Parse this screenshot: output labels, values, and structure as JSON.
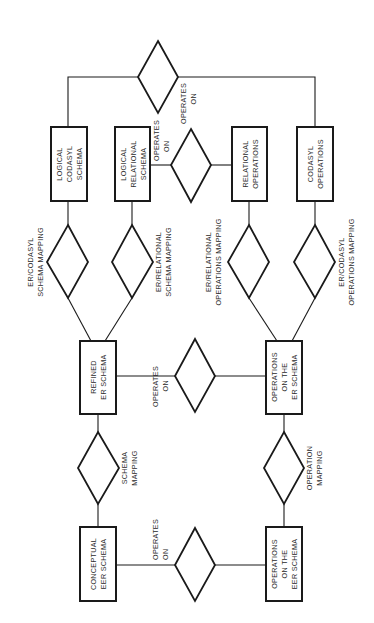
{
  "diagram": {
    "entities": {
      "logical_codasyl_schema": [
        "LOGICAL",
        "CODASYL",
        "SCHEMA"
      ],
      "logical_relational_schema": [
        "LOGICAL",
        "RELATIONAL",
        "SCHEMA"
      ],
      "relational_operations": [
        "RELATIONAL",
        "OPERATIONS"
      ],
      "codasyl_operations": [
        "CODASYL",
        "OPERATIONS"
      ],
      "refined_er_schema": [
        "REFINED",
        "ER SCHEMA"
      ],
      "operations_on_er_schema": [
        "OPERATIONS",
        "ON THE",
        "ER SCHEMA"
      ],
      "conceptual_eer_schema": [
        "CONCEPTUAL",
        "EER SCHEMA"
      ],
      "operations_on_eer_schema": [
        "OPERATIONS",
        "ON THE",
        "EER SCHEMA"
      ]
    },
    "relationships": {
      "top_operates_on": [
        "OPERATES",
        "ON"
      ],
      "relational_operates_on": [
        "OPERATES",
        "ON"
      ],
      "er_codasyl_schema_mapping": [
        "ER/CODASYL",
        "SCHEMA MAPPING"
      ],
      "er_relational_schema_mapping": [
        "ER/RELATIONAL",
        "SCHEMA MAPPING"
      ],
      "er_relational_operations_mapping": [
        "ER/RELATIONAL",
        "OPERATIONS MAPPING"
      ],
      "er_codasyl_operations_mapping": [
        "ER/CODASYL",
        "OPERATIONS MAPPING"
      ],
      "refined_operates_on": [
        "OPERATES",
        "ON"
      ],
      "schema_mapping": [
        "SCHEMA",
        "MAPPING"
      ],
      "operation_mapping": [
        "OPERATION",
        "MAPPING"
      ],
      "conceptual_operates_on": [
        "OPERATES",
        "ON"
      ]
    }
  }
}
